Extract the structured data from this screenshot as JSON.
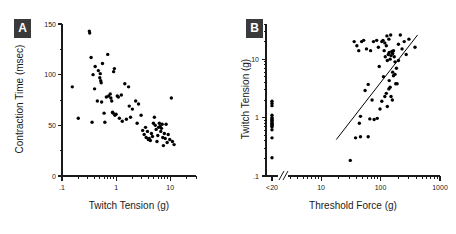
{
  "figure": {
    "background": "#ffffff",
    "marker_color": "#000000",
    "axis_color": "#1a1a1a",
    "tag_background": "#3a3a3a",
    "tag_text_color": "#ffffff"
  },
  "panels": [
    {
      "tag": "A",
      "chart_data": {
        "type": "scatter",
        "title": "",
        "xlabel": "Twitch Tension (g)",
        "ylabel": "Contraction Time (msec)",
        "xscale": "log",
        "yscale": "linear",
        "xlim": [
          0.1,
          30
        ],
        "ylim": [
          0,
          150
        ],
        "grid": false,
        "legend": null,
        "xticks": [
          0.1,
          1,
          10
        ],
        "xtick_labels": [
          ".1",
          "1",
          "10"
        ],
        "yticks": [
          0,
          50,
          100,
          150
        ],
        "ytick_labels": [
          "0",
          "50",
          "100",
          "150"
        ],
        "yminor_ticks": [
          25,
          75,
          125
        ],
        "points": [
          [
            0.155,
            88
          ],
          [
            0.2,
            57
          ],
          [
            0.32,
            143
          ],
          [
            0.325,
            141
          ],
          [
            0.345,
            117
          ],
          [
            0.36,
            53
          ],
          [
            0.375,
            100
          ],
          [
            0.4,
            86
          ],
          [
            0.41,
            108
          ],
          [
            0.47,
            104
          ],
          [
            0.5,
            97
          ],
          [
            0.51,
            101
          ],
          [
            0.52,
            94
          ],
          [
            0.53,
            92
          ],
          [
            0.54,
            73
          ],
          [
            0.45,
            74
          ],
          [
            0.56,
            111
          ],
          [
            0.6,
            62
          ],
          [
            0.62,
            53
          ],
          [
            0.66,
            78
          ],
          [
            0.7,
            120
          ],
          [
            0.73,
            79
          ],
          [
            0.78,
            81
          ],
          [
            0.8,
            77
          ],
          [
            0.83,
            74
          ],
          [
            0.86,
            63
          ],
          [
            0.88,
            62
          ],
          [
            0.9,
            103
          ],
          [
            0.93,
            106
          ],
          [
            0.95,
            60
          ],
          [
            1.0,
            61
          ],
          [
            1.05,
            79
          ],
          [
            1.1,
            78
          ],
          [
            1.15,
            57
          ],
          [
            1.25,
            80
          ],
          [
            1.3,
            54
          ],
          [
            1.45,
            91
          ],
          [
            1.55,
            56
          ],
          [
            1.7,
            88
          ],
          [
            1.75,
            69
          ],
          [
            1.85,
            58
          ],
          [
            2.0,
            66
          ],
          [
            2.3,
            74
          ],
          [
            2.45,
            52
          ],
          [
            2.6,
            71
          ],
          [
            2.9,
            60
          ],
          [
            3.1,
            45
          ],
          [
            3.3,
            41
          ],
          [
            3.5,
            48
          ],
          [
            3.6,
            38
          ],
          [
            3.8,
            44
          ],
          [
            3.95,
            36
          ],
          [
            4.1,
            37
          ],
          [
            4.3,
            35
          ],
          [
            4.5,
            42
          ],
          [
            4.7,
            39
          ],
          [
            4.9,
            52
          ],
          [
            5.1,
            58
          ],
          [
            5.3,
            50
          ],
          [
            5.5,
            46
          ],
          [
            5.7,
            34
          ],
          [
            5.9,
            40
          ],
          [
            6.1,
            48
          ],
          [
            6.3,
            52
          ],
          [
            6.5,
            49
          ],
          [
            6.7,
            44
          ],
          [
            6.9,
            47
          ],
          [
            7.1,
            51
          ],
          [
            7.3,
            38
          ],
          [
            7.5,
            30
          ],
          [
            7.8,
            42
          ],
          [
            8.1,
            37
          ],
          [
            8.4,
            51
          ],
          [
            8.8,
            33
          ],
          [
            9.2,
            41
          ],
          [
            9.8,
            36
          ],
          [
            10.5,
            77
          ],
          [
            11.0,
            34
          ],
          [
            11.8,
            31
          ]
        ]
      }
    },
    {
      "tag": "B",
      "chart_data": {
        "type": "scatter",
        "title": "",
        "xlabel": "Threshold Force (g)",
        "ylabel": "Twitch Tension (g)",
        "xscale": "log",
        "yscale": "log",
        "xlim": [
          3,
          1000
        ],
        "ylim": [
          0.1,
          40
        ],
        "grid": false,
        "legend": null,
        "axis_break": true,
        "xticks": [
          10,
          100,
          1000
        ],
        "xtick_labels": [
          "10",
          "100",
          "1000"
        ],
        "offscale_tick_label": "<20",
        "yticks": [
          0.1,
          1,
          10
        ],
        "ytick_labels": [
          ".1",
          "1",
          "10"
        ],
        "regression_line": {
          "x_start": 18,
          "y_start": 0.42,
          "x_end": 420,
          "y_end": 26
        },
        "offscale_points": [
          [
            0.205
          ],
          [
            1.9
          ],
          [
            1.75
          ],
          [
            1.6
          ],
          [
            1.1
          ],
          [
            1.0
          ],
          [
            0.95
          ],
          [
            0.92
          ],
          [
            0.88
          ],
          [
            0.85
          ],
          [
            0.8
          ],
          [
            0.78
          ],
          [
            0.75
          ],
          [
            0.72
          ],
          [
            0.7
          ],
          [
            0.62
          ],
          [
            0.45
          ]
        ],
        "points": [
          [
            31,
            0.185
          ],
          [
            38,
            0.45
          ],
          [
            46,
            0.47
          ],
          [
            62,
            0.47
          ],
          [
            46,
            1.05
          ],
          [
            44,
            0.8
          ],
          [
            66,
            0.95
          ],
          [
            78,
            0.93
          ],
          [
            55,
            2.9
          ],
          [
            88,
            0.97
          ],
          [
            62,
            3.7
          ],
          [
            98,
            1.4
          ],
          [
            105,
            1.9
          ],
          [
            72,
            2.0
          ],
          [
            118,
            2.3
          ],
          [
            125,
            2.6
          ],
          [
            130,
            1.55
          ],
          [
            138,
            3.1
          ],
          [
            140,
            4.3
          ],
          [
            145,
            3.3
          ],
          [
            112,
            5.0
          ],
          [
            150,
            2.3
          ],
          [
            158,
            2.0
          ],
          [
            165,
            5.2
          ],
          [
            95,
            7.5
          ],
          [
            115,
            14
          ],
          [
            120,
            11
          ],
          [
            125,
            17
          ],
          [
            130,
            9.5
          ],
          [
            135,
            12
          ],
          [
            140,
            13
          ],
          [
            145,
            10
          ],
          [
            150,
            11.5
          ],
          [
            155,
            13.5
          ],
          [
            160,
            12.5
          ],
          [
            165,
            14
          ],
          [
            170,
            11
          ],
          [
            175,
            9.0
          ],
          [
            180,
            3.8
          ],
          [
            190,
            3.8
          ],
          [
            105,
            20
          ],
          [
            110,
            21
          ],
          [
            118,
            19
          ],
          [
            128,
            25
          ],
          [
            138,
            22
          ],
          [
            148,
            26
          ],
          [
            86,
            21
          ],
          [
            92,
            16
          ],
          [
            76,
            20
          ],
          [
            68,
            14
          ],
          [
            58,
            15
          ],
          [
            52,
            21
          ],
          [
            48,
            20
          ],
          [
            43,
            14
          ],
          [
            40,
            17
          ],
          [
            36,
            20
          ],
          [
            200,
            18
          ],
          [
            215,
            26
          ],
          [
            230,
            15
          ],
          [
            250,
            20
          ],
          [
            270,
            12
          ],
          [
            300,
            22
          ],
          [
            380,
            16
          ],
          [
            200,
            9.5
          ],
          [
            185,
            7.0
          ],
          [
            175,
            5.5
          ],
          [
            160,
            6.0
          ]
        ]
      }
    }
  ]
}
